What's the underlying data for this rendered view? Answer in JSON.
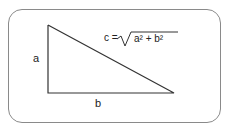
{
  "diagram": {
    "labels": {
      "side_a": "a",
      "side_b": "b"
    },
    "formula": {
      "lhs": "c =",
      "radicand": "a² + b²"
    }
  }
}
